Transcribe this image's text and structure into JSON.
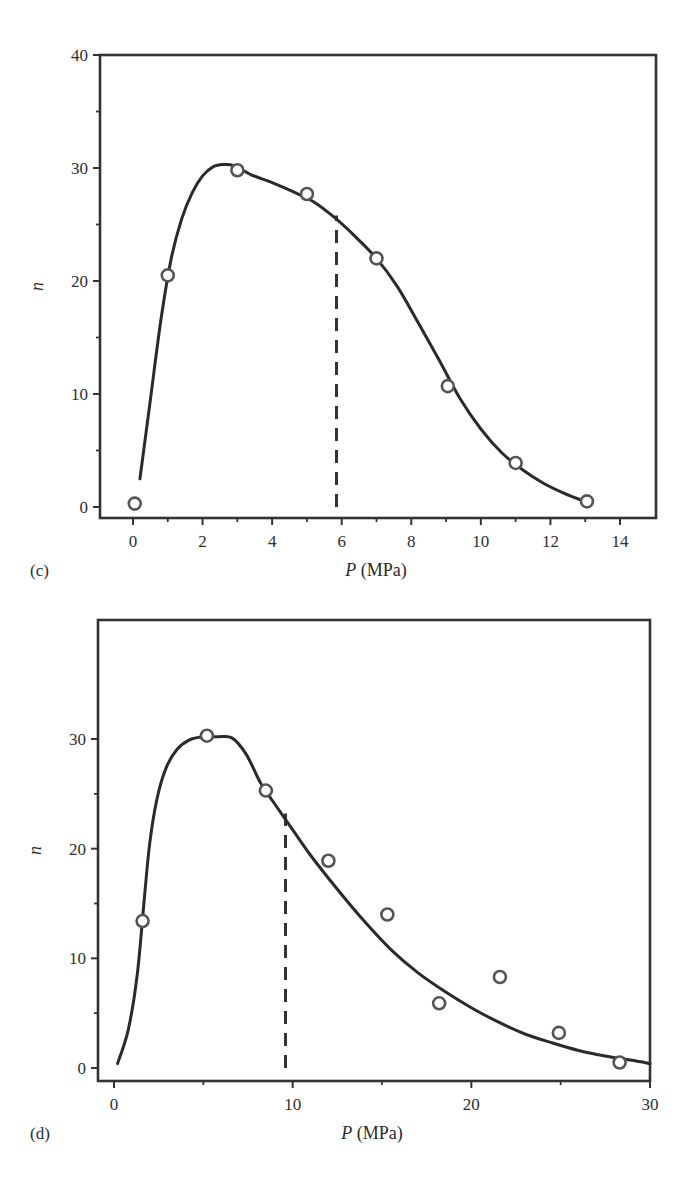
{
  "chart_data": [
    {
      "id": "c",
      "type": "scatter",
      "panel_label": "(c)",
      "title": "",
      "xlabel": "P (MPa)",
      "xlabel_var": "P",
      "xlabel_unit": "(MPa)",
      "ylabel": "n",
      "xlim": [
        -1,
        15
      ],
      "ylim": [
        -1,
        40
      ],
      "xticks": [
        0,
        2,
        4,
        6,
        8,
        10,
        12,
        14
      ],
      "xminor": [
        1,
        3,
        5,
        7,
        9,
        11,
        13
      ],
      "yticks": [
        0,
        10,
        20,
        30,
        40
      ],
      "yminor": [
        5,
        15,
        25,
        35
      ],
      "grid": false,
      "legend": null,
      "series": [
        {
          "name": "measured",
          "style": "open-circle",
          "x": [
            0.05,
            1.0,
            3.0,
            5.0,
            7.0,
            9.05,
            11.0,
            13.05
          ],
          "y": [
            0.3,
            20.5,
            29.8,
            27.7,
            22.0,
            10.7,
            3.9,
            0.5
          ]
        },
        {
          "name": "fit curve",
          "style": "solid-line",
          "x": [
            0.2,
            0.5,
            0.8,
            1.1,
            1.4,
            1.7,
            2.0,
            2.3,
            2.6,
            2.9,
            3.4,
            4.0,
            4.6,
            5.2,
            5.8,
            6.4,
            7.0,
            7.6,
            8.2,
            8.8,
            9.4,
            10.0,
            10.6,
            11.2,
            11.8,
            12.4,
            12.9
          ],
          "y": [
            2.5,
            9.5,
            16.5,
            22.0,
            25.5,
            27.8,
            29.3,
            30.1,
            30.3,
            30.2,
            29.4,
            28.7,
            27.9,
            27.0,
            25.6,
            23.9,
            22.0,
            19.5,
            16.3,
            13.0,
            9.6,
            6.9,
            4.8,
            3.3,
            2.1,
            1.2,
            0.6
          ]
        }
      ],
      "annotations": [
        {
          "type": "vertical-dashed-line",
          "x": 5.85,
          "y_from": 0.0,
          "y_to": 25.8
        }
      ]
    },
    {
      "id": "d",
      "type": "scatter",
      "panel_label": "(d)",
      "title": "",
      "xlabel": "P (MPa)",
      "xlabel_var": "P",
      "xlabel_unit": "(MPa)",
      "ylabel": "n",
      "xlim": [
        -1,
        30
      ],
      "ylim": [
        -1.2,
        35
      ],
      "xticks": [
        0,
        10,
        20,
        30
      ],
      "xminor": [
        5,
        15,
        25
      ],
      "yticks": [
        0,
        10,
        20,
        30
      ],
      "yminor": [
        5,
        15,
        25
      ],
      "grid": false,
      "legend": null,
      "series": [
        {
          "name": "measured",
          "style": "open-circle",
          "x": [
            1.6,
            5.2,
            8.5,
            12.0,
            15.3,
            18.2,
            21.6,
            24.9,
            28.3
          ],
          "y": [
            13.4,
            30.3,
            25.3,
            18.9,
            14.0,
            5.9,
            8.3,
            3.2,
            0.5
          ]
        },
        {
          "name": "fit curve",
          "style": "solid-line",
          "x": [
            0.2,
            0.8,
            1.3,
            1.7,
            2.0,
            2.4,
            2.9,
            3.5,
            4.2,
            5.0,
            5.8,
            6.6,
            7.4,
            8.2,
            8.9,
            9.8,
            11.0,
            12.5,
            14.0,
            15.5,
            17.0,
            18.5,
            20.0,
            21.5,
            23.0,
            24.5,
            26.0,
            27.5,
            29.0,
            30.0
          ],
          "y": [
            0.4,
            3.5,
            8.5,
            15.5,
            20.5,
            24.5,
            27.3,
            29.0,
            29.9,
            30.2,
            30.2,
            30.1,
            28.6,
            26.0,
            24.3,
            22.2,
            19.4,
            16.3,
            13.4,
            10.8,
            8.7,
            7.0,
            5.5,
            4.2,
            3.1,
            2.3,
            1.6,
            1.1,
            0.7,
            0.4
          ]
        }
      ],
      "annotations": [
        {
          "type": "vertical-dashed-line",
          "x": 9.6,
          "y_from": 0.0,
          "y_to": 23.2
        }
      ]
    }
  ],
  "layout": {
    "stroke_color": "#333333",
    "marker_color": "#555555",
    "background": "#ffffff",
    "plots": [
      {
        "left": 100,
        "top": 55,
        "right": 656,
        "bottom": 518,
        "x0px": 133,
        "x1px": 620,
        "x0": 0,
        "x1": 14,
        "y0px": 507,
        "y1px": 55,
        "y0": 0,
        "y1": 40
      },
      {
        "left": 98,
        "top": 40,
        "right": 650,
        "bottom": 501,
        "x0px": 114,
        "x1px": 650,
        "x0": 0,
        "x1": 30,
        "y0px": 488,
        "y1px": 159,
        "y0": 0,
        "y1": 30
      }
    ]
  }
}
